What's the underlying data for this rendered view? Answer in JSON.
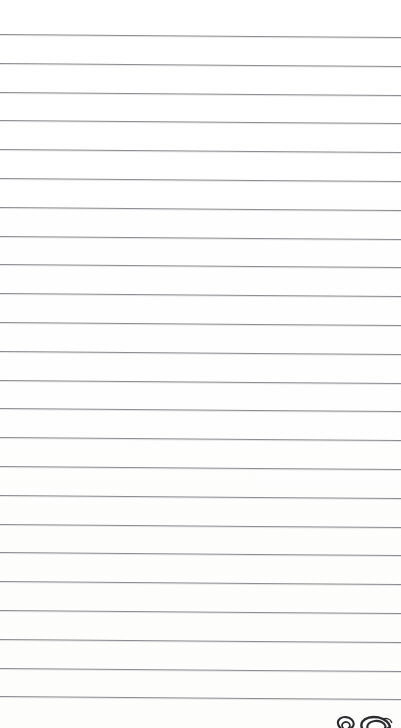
{
  "document": {
    "type": "lined-paper",
    "title": "Blank ruled notebook page",
    "page_width": 401,
    "page_height": 728,
    "background_color": "#ffffff",
    "text_content": "",
    "is_blank": true
  },
  "ruling": {
    "line_color": "#8b8b91",
    "line_count": 24,
    "line_thickness_px": 1,
    "first_line_y": 34,
    "line_spacing_px": 28.8,
    "tilt_degrees": 0.43,
    "top_margin_px": 33,
    "left_margin_px": 0,
    "description": "Horizontal ruled lines spanning full page width, slightly tilted downward toward the right"
  },
  "annotations": {
    "doodle_label": "hand-drawn marks clipped at bottom edge",
    "marks": [
      {
        "name": "spiral-circle-doodle",
        "x": 347,
        "y": 726,
        "color": "#2b2b2f",
        "description": "small circular spiral glyph, partially cut off by page bottom"
      },
      {
        "name": "swirl-loop-doodle",
        "x": 377,
        "y": 725,
        "color": "#2b2b2f",
        "description": "larger looping swirl glyph, partially cut off by page bottom"
      }
    ]
  }
}
